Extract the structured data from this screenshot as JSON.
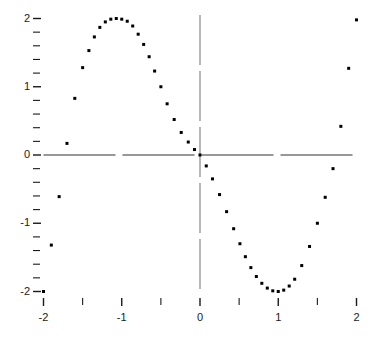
{
  "chart_data": {
    "type": "scatter",
    "title": "",
    "xlabel": "",
    "ylabel": "",
    "xlim": [
      -2,
      2
    ],
    "ylim": [
      -2.1,
      2.1
    ],
    "grid": false,
    "legend": null,
    "marker": {
      "shape": "square-dot",
      "size_px": 3,
      "color": "#000000"
    },
    "axis_style": {
      "zero_axes": true,
      "x_axis_line_color": "#333333",
      "y_axis_line_color": "#888888",
      "x_axis_line_dashed": true,
      "y_axis_line_dashed": true
    },
    "x_ticks_major": [
      -2,
      -1,
      0,
      1,
      2
    ],
    "x_tick_labels": [
      "-2",
      "-1",
      "0",
      "1",
      "2"
    ],
    "x_ticks_minor": [
      -1.5,
      -0.5,
      0.5,
      1.5
    ],
    "y_ticks_major": [
      -2,
      -1,
      0,
      1,
      2
    ],
    "y_tick_labels": [
      "-2",
      "-1",
      "0",
      "1",
      "2"
    ],
    "y_ticks_minor": [
      -1.8,
      -1.6,
      -1.4,
      -1.2,
      -0.8,
      -0.6,
      -0.4,
      -0.2,
      0.2,
      0.4,
      0.6,
      0.8,
      1.2,
      1.4,
      1.6,
      1.8
    ],
    "series": [
      {
        "name": "points",
        "x": [
          -2.0,
          -1.9,
          -1.8,
          -1.7,
          -1.6,
          -1.5,
          -1.42,
          -1.35,
          -1.28,
          -1.21,
          -1.14,
          -1.07,
          -1.0,
          -0.93,
          -0.86,
          -0.79,
          -0.72,
          -0.65,
          -0.58,
          -0.5,
          -0.42,
          -0.33,
          -0.24,
          -0.15,
          -0.07,
          0.0,
          0.08,
          0.16,
          0.25,
          0.34,
          0.43,
          0.51,
          0.58,
          0.65,
          0.72,
          0.79,
          0.86,
          0.93,
          1.0,
          1.07,
          1.14,
          1.21,
          1.3,
          1.4,
          1.5,
          1.6,
          1.7,
          1.8,
          1.9,
          2.0
        ],
        "y": [
          -2.0,
          -1.32,
          -0.61,
          0.17,
          0.83,
          1.28,
          1.53,
          1.73,
          1.87,
          1.95,
          1.99,
          2.0,
          1.99,
          1.96,
          1.89,
          1.77,
          1.62,
          1.44,
          1.23,
          1.0,
          0.75,
          0.52,
          0.33,
          0.19,
          0.08,
          0.0,
          -0.16,
          -0.35,
          -0.58,
          -0.83,
          -1.08,
          -1.3,
          -1.49,
          -1.65,
          -1.78,
          -1.88,
          -1.95,
          -1.99,
          -2.0,
          -1.98,
          -1.92,
          -1.82,
          -1.62,
          -1.34,
          -1.0,
          -0.62,
          -0.2,
          0.42,
          1.27,
          1.98
        ]
      }
    ]
  },
  "axes": {
    "y_labels": [
      {
        "text": "2",
        "value": 2
      },
      {
        "text": "1",
        "value": 1
      },
      {
        "text": "0",
        "value": 0
      },
      {
        "text": "-1",
        "value": -1
      },
      {
        "text": "-2",
        "value": -2
      }
    ],
    "x_labels": [
      {
        "text": "-2",
        "value": -2
      },
      {
        "text": "-1",
        "value": -1
      },
      {
        "text": "0",
        "value": 0
      },
      {
        "text": "1",
        "value": 1
      },
      {
        "text": "2",
        "value": 2
      }
    ]
  }
}
